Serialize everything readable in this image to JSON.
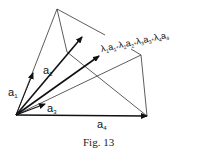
{
  "figure": {
    "caption": "Fig. 13",
    "vectors": [
      {
        "name": "a1",
        "label": "a",
        "subscript": "1"
      },
      {
        "name": "a2",
        "label": "a",
        "subscript": "2"
      },
      {
        "name": "a3",
        "label": "a",
        "subscript": "3"
      },
      {
        "name": "a4",
        "label": "a",
        "subscript": "4"
      }
    ],
    "combination": {
      "terms": [
        {
          "coef": "λ",
          "coef_sub": "1",
          "vec": "a",
          "vec_sub": "1"
        },
        {
          "coef": "λ",
          "coef_sub": "2",
          "vec": "a",
          "vec_sub": "2"
        },
        {
          "coef": "λ",
          "coef_sub": "3",
          "vec": "a",
          "vec_sub": "3"
        },
        {
          "coef": "λ",
          "coef_sub": "4",
          "vec": "a",
          "vec_sub": "4"
        }
      ],
      "operator": "+"
    }
  }
}
